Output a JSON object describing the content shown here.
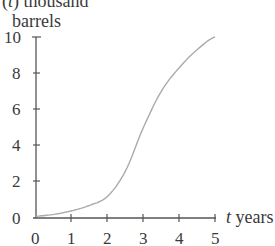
{
  "chart_data": {
    "type": "line",
    "title": "",
    "ylabel_line1_prefix": "(",
    "ylabel_var": "t",
    "ylabel_line1_suffix": ") thousand",
    "ylabel_line2": "barrels",
    "xlabel_var": "t",
    "xlabel_unit": " years",
    "xlim": [
      0,
      5
    ],
    "ylim": [
      0,
      10
    ],
    "x_ticks": [
      "0",
      "1",
      "2",
      "3",
      "4",
      "5"
    ],
    "y_ticks": [
      "0",
      "2",
      "4",
      "6",
      "8",
      "10"
    ],
    "grid": false,
    "legend": null,
    "series": [
      {
        "name": "cumulative barrels",
        "x": [
          0,
          0.5,
          1,
          1.5,
          2,
          2.5,
          3,
          3.5,
          4,
          4.5,
          5
        ],
        "values": [
          0.1,
          0.2,
          0.4,
          0.7,
          1.2,
          2.6,
          5.0,
          7.0,
          8.3,
          9.3,
          10.0
        ]
      }
    ],
    "colors": {
      "axis": "#555555",
      "curve": "#aaaaaa"
    }
  }
}
